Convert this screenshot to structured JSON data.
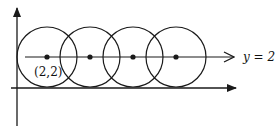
{
  "diagram": {
    "type": "coordinate-geometry",
    "line_label": "y = 2",
    "point_label": "(2,2)",
    "stroke_color": "#1a1a1a",
    "axes": {
      "x_axis": {
        "y": 88,
        "x_start": 11,
        "x_end": 236
      },
      "y_axis": {
        "x": 17,
        "y_start": 126,
        "y_end": 8
      }
    },
    "center_line": {
      "y": 57,
      "x_start": 25,
      "x_end": 234
    },
    "radius": 30,
    "circles": [
      {
        "cx": 47,
        "cy": 57
      },
      {
        "cx": 90,
        "cy": 57
      },
      {
        "cx": 133,
        "cy": 57
      },
      {
        "cx": 176,
        "cy": 57
      }
    ]
  }
}
